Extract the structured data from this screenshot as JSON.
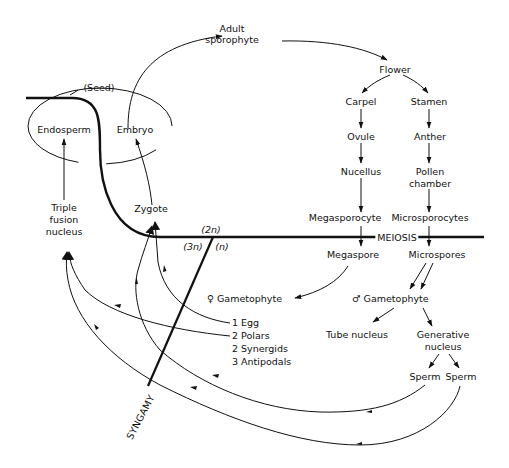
{
  "diagram": {
    "type": "life-cycle",
    "nodes": {
      "adult_sporophyte": "Adult\nsporophyte",
      "flower": "Flower",
      "carpel": "Carpel",
      "stamen": "Stamen",
      "ovule": "Ovule",
      "anther": "Anther",
      "nucellus": "Nucellus",
      "pollen_chamber": "Pollen\nchamber",
      "megasporocyte": "Megasporocyte",
      "microsporocytes": "Microsporocytes",
      "meiosis": "MEIOSIS",
      "megaspore": "Megaspore",
      "microspores": "Microspores",
      "female_gametophyte": "Gametophyte",
      "female_symbol": "♀",
      "male_gametophyte": "Gametophyte",
      "male_symbol": "♂",
      "tube_nucleus": "Tube nucleus",
      "generative_nucleus": "Generative\nnucleus",
      "sperm_1": "Sperm",
      "sperm_2": "Sperm",
      "egg": "1 Egg",
      "polars": "2 Polars",
      "synergids": "2 Synergids",
      "antipodals": "3 Antipodals",
      "zygote": "Zygote",
      "triple_fusion": "Triple\nfusion\nnucleus",
      "endosperm": "Endosperm",
      "embryo": "Embryo",
      "seed": "(Seed)",
      "syngamy": "SYNGAMY",
      "ploidy_2n": "(2n)",
      "ploidy_3n": "(3n)",
      "ploidy_n": "(n)"
    },
    "edges": [
      [
        "Adult sporophyte",
        "Flower"
      ],
      [
        "Flower",
        "Carpel"
      ],
      [
        "Flower",
        "Stamen"
      ],
      [
        "Carpel",
        "Ovule"
      ],
      [
        "Ovule",
        "Nucellus"
      ],
      [
        "Nucellus",
        "Megasporocyte"
      ],
      [
        "Megasporocyte",
        "Megaspore"
      ],
      [
        "Stamen",
        "Anther"
      ],
      [
        "Anther",
        "Pollen chamber"
      ],
      [
        "Pollen chamber",
        "Microsporocytes"
      ],
      [
        "Microsporocytes",
        "Microspores"
      ],
      [
        "Megaspore",
        "Female Gametophyte"
      ],
      [
        "Microspores",
        "Male Gametophyte"
      ],
      [
        "Male Gametophyte",
        "Tube nucleus"
      ],
      [
        "Male Gametophyte",
        "Generative nucleus"
      ],
      [
        "Generative nucleus",
        "Sperm"
      ],
      [
        "Generative nucleus",
        "Sperm"
      ],
      [
        "1 Egg",
        "Zygote"
      ],
      [
        "2 Polars",
        "Triple fusion nucleus"
      ],
      [
        "Sperm",
        "Zygote"
      ],
      [
        "Sperm",
        "Triple fusion nucleus"
      ],
      [
        "Zygote",
        "Embryo"
      ],
      [
        "Triple fusion nucleus",
        "Endosperm"
      ],
      [
        "Embryo",
        "Adult sporophyte"
      ]
    ]
  }
}
